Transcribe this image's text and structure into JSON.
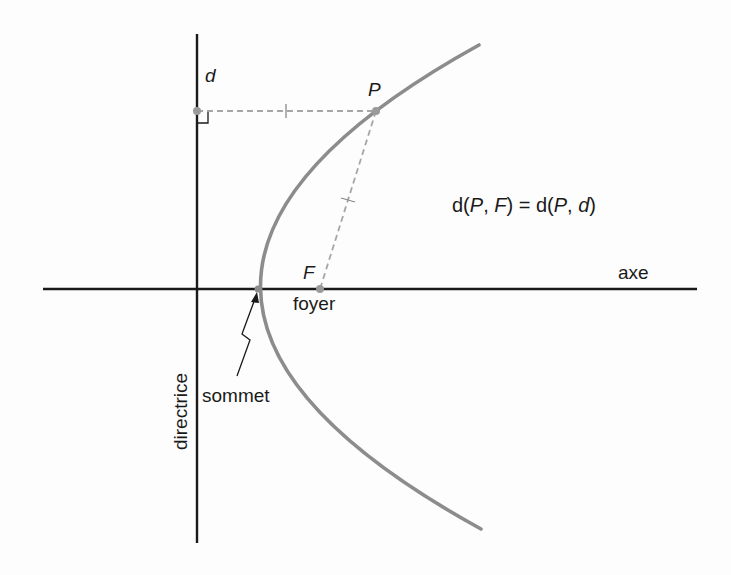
{
  "diagram": {
    "colors": {
      "axis": "#1a1a1a",
      "curve": "#8c8c8c",
      "dashed": "#a6a6a6",
      "points": "#9a9a9a",
      "text": "#1a1a1a"
    },
    "labels": {
      "directrix_name": "d",
      "point_p": "P",
      "point_f": "F",
      "focus": "foyer",
      "vertex": "sommet",
      "axis": "axe",
      "directrix": "directrice"
    },
    "equation": {
      "lhs_func": "d(",
      "lhs_p": "P",
      "lhs_sep": ", ",
      "lhs_f": "F",
      "lhs_close": ")",
      "equals": " = ",
      "rhs_func": "d(",
      "rhs_p": "P",
      "rhs_sep": ", ",
      "rhs_d": "d",
      "rhs_close": ")"
    },
    "geometry": {
      "axis_y": 289,
      "directrix_x": 197,
      "vertex": [
        258,
        289
      ],
      "focus": [
        320,
        289
      ],
      "point_p": [
        376,
        111
      ],
      "foot_on_directrix": [
        197,
        111
      ]
    }
  }
}
